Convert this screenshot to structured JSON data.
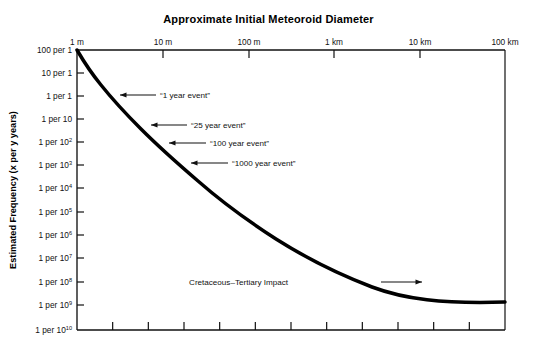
{
  "chart_data": {
    "type": "line",
    "title": "Approximate Initial Meteoroid Diameter",
    "xlabel": "Approximate Initial Meteoroid Diameter",
    "ylabel": "Estimated Frequency (x per y years)",
    "x_axis_position": "top",
    "x_scale": "log",
    "y_scale": "log",
    "grid": false,
    "legend": null,
    "x_tick_labels": [
      "1 m",
      "10 m",
      "100 m",
      "1 km",
      "10 km",
      "100 km"
    ],
    "x_tick_values_m": [
      1,
      10,
      100,
      1000,
      10000,
      100000
    ],
    "xlim_m": [
      1,
      100000
    ],
    "y_tick_labels": [
      "100 per 1",
      "10 per 1",
      "1 per 1",
      "1 per 10",
      "1 per 10^2",
      "1 per 10^3",
      "1 per 10^4",
      "1 per 10^5",
      "1 per 10^6",
      "1 per 10^7",
      "1 per 10^8",
      "1 per 10^9",
      "1 per 10^10"
    ],
    "y_tick_frequency_per_year": [
      100,
      10,
      1,
      0.1,
      0.01,
      0.001,
      0.0001,
      1e-05,
      1e-06,
      1e-07,
      1e-08,
      1e-09,
      1e-10
    ],
    "ylim_frequency_per_year": [
      100,
      1e-10
    ],
    "minor_x_ticks_bottom": 11,
    "series": [
      {
        "name": "Estimated impact frequency vs meteoroid diameter",
        "x_diameter_m": [
          1,
          2,
          4,
          8,
          16,
          32,
          70,
          150,
          320,
          700,
          1500,
          3200,
          7000,
          15000,
          32000,
          70000,
          100000
        ],
        "y_frequency_per_year": [
          60,
          18,
          6.0,
          2.0,
          0.65,
          0.22,
          0.06,
          0.018,
          0.0052,
          0.0014,
          0.00034,
          8.5e-05,
          2e-05,
          4.5e-06,
          1e-06,
          2.6e-07,
          1.4e-07
        ]
      }
    ],
    "annotations": [
      {
        "label": "“1 year event”",
        "diameter_m": 2.5,
        "frequency_per_year": 1
      },
      {
        "label": "“25 year event”",
        "diameter_m": 9,
        "frequency_per_year": 0.04
      },
      {
        "label": "“100 year event”",
        "diameter_m": 17,
        "frequency_per_year": 0.01
      },
      {
        "label": "“1000 year event”",
        "diameter_m": 37,
        "frequency_per_year": 0.001
      },
      {
        "label": "Cretaceous–Tertiary Impact",
        "diameter_m": 12000,
        "frequency_per_year": 6e-08
      }
    ]
  },
  "axes": {
    "x_ticks": [
      {
        "label": "1 m",
        "px": 77
      },
      {
        "label": "10 m",
        "px": 163
      },
      {
        "label": "100 m",
        "px": 249
      },
      {
        "label": "1 km",
        "px": 334
      },
      {
        "label": "10 km",
        "px": 420
      },
      {
        "label": "100 km",
        "px": 505
      }
    ],
    "y_ticks": [
      {
        "base": "100 per 1",
        "sup": "",
        "px": 50
      },
      {
        "base": "10 per 1",
        "sup": "",
        "px": 73
      },
      {
        "base": "1 per 1",
        "sup": "",
        "px": 96
      },
      {
        "base": "1 per 10",
        "sup": "",
        "px": 119
      },
      {
        "base": "1 per 10",
        "sup": "2",
        "px": 142
      },
      {
        "base": "1 per 10",
        "sup": "3",
        "px": 165
      },
      {
        "base": "1 per 10",
        "sup": "4",
        "px": 188
      },
      {
        "base": "1 per 10",
        "sup": "5",
        "px": 212
      },
      {
        "base": "1 per 10",
        "sup": "6",
        "px": 235
      },
      {
        "base": "1 per 10",
        "sup": "7",
        "px": 258
      },
      {
        "base": "1 per 10",
        "sup": "8",
        "px": 282
      },
      {
        "base": "1 per 10",
        "sup": "9",
        "px": 305
      },
      {
        "base": "1 per 10",
        "sup": "10",
        "px": 330
      }
    ],
    "y_axis_title": "Estimated Frequency (x per y years)"
  },
  "annotation_layout": [
    {
      "key": "a1",
      "text": "“1 year event”",
      "text_x": 160,
      "text_y": 98,
      "tip_x": 120,
      "tip_y": 95,
      "tail_x": 156
    },
    {
      "key": "a2",
      "text": "“25 year event”",
      "text_x": 191,
      "text_y": 128,
      "tip_x": 151,
      "tip_y": 125,
      "tail_x": 187
    },
    {
      "key": "a3",
      "text": "“100 year event”",
      "text_x": 210,
      "text_y": 146,
      "tip_x": 169,
      "tip_y": 143,
      "tail_x": 206
    },
    {
      "key": "a4",
      "text": "“1000 year event”",
      "text_x": 232,
      "text_y": 166,
      "tip_x": 191,
      "tip_y": 163,
      "tail_x": 228
    },
    {
      "key": "a5",
      "text": "Cretaceous–Tertiary Impact",
      "text_x": 288,
      "text_y": 285,
      "tip_x": 422,
      "tip_y": 282,
      "tail_x": 381
    }
  ]
}
